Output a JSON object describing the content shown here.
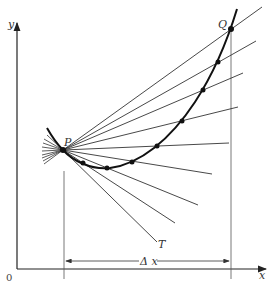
{
  "diagram": {
    "labels": {
      "y_axis": "y",
      "x_axis": "x",
      "origin": "0",
      "point_p": "P",
      "point_q": "Q",
      "tangent": "T",
      "delta_x": "Δ x"
    },
    "colors": {
      "ink": "#222222",
      "thin_line": "#444444",
      "background": "#ffffff"
    },
    "points": {
      "P": [
        63,
        150
      ],
      "Q": [
        231,
        29
      ],
      "curve_dots": [
        [
          83,
          163
        ],
        [
          107,
          168
        ],
        [
          132,
          162
        ],
        [
          157,
          146
        ],
        [
          182,
          121
        ],
        [
          203,
          90
        ],
        [
          218,
          62
        ]
      ]
    },
    "secant_line_ends": [
      [
        262,
        7
      ],
      [
        256,
        41
      ],
      [
        243,
        73
      ],
      [
        238,
        107
      ],
      [
        229,
        143
      ],
      [
        212,
        174
      ],
      [
        198,
        205
      ],
      [
        175,
        223
      ]
    ],
    "tangent_end": [
      157,
      242
    ]
  }
}
